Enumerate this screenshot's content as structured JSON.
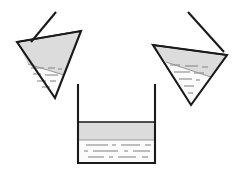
{
  "figure": {
    "background_color": "#ffffff",
    "width": 245,
    "height": 171,
    "stroke_color": "#1a1a1a",
    "liquid_band_color": "#dcdcdc",
    "liquid_body_color": "#fbfbfb",
    "dash_color": "#8a8a8a",
    "vessel_fill_color": "#ffffff"
  },
  "containers": [
    {
      "id": "left-funnel",
      "label": "Left tilted funnel",
      "shape": "cone",
      "orientation": "tilted-left",
      "has_stem": true,
      "stem_label": "Left funnel stem",
      "liquid_label": "Left funnel liquid",
      "surface_label": "Left funnel liquid surface",
      "outline_points": "17,42 81,31 55,98",
      "rim_points": "17,42 81,31",
      "stem_points": "31,42 56,12",
      "liquid_polygon": "17,42 81,31 64,75 28,64",
      "liquid_lower_polygon": "28,64 64,75 55,98",
      "surface_line": "17,42 81,31",
      "band_line": "28,64 64,75",
      "dashes": [
        {
          "x1": 31,
          "y1": 68,
          "x2": 44,
          "y2": 68
        },
        {
          "x1": 48,
          "y1": 68,
          "x2": 55,
          "y2": 68
        },
        {
          "x1": 58,
          "y1": 69,
          "x2": 62,
          "y2": 69
        },
        {
          "x1": 33,
          "y1": 74,
          "x2": 41,
          "y2": 74
        },
        {
          "x1": 45,
          "y1": 75,
          "x2": 58,
          "y2": 75
        },
        {
          "x1": 37,
          "y1": 81,
          "x2": 46,
          "y2": 81
        },
        {
          "x1": 50,
          "y1": 81,
          "x2": 56,
          "y2": 81
        },
        {
          "x1": 42,
          "y1": 87,
          "x2": 50,
          "y2": 87
        }
      ]
    },
    {
      "id": "right-funnel",
      "label": "Right tilted funnel",
      "shape": "cone",
      "orientation": "tilted-right",
      "has_stem": true,
      "stem_label": "Right funnel stem",
      "liquid_label": "Right funnel liquid",
      "surface_label": "Right funnel liquid surface",
      "outline_points": "153,45 227,55 191,105",
      "rim_points": "153,45 227,55",
      "stem_points": "224,52 188,12",
      "liquid_polygon": "153,45 227,55 211,77 166,62",
      "liquid_lower_polygon": "166,62 211,77 191,105",
      "surface_line": "153,45 227,55",
      "band_line": "166,62 211,77",
      "dashes": [
        {
          "x1": 170,
          "y1": 65,
          "x2": 180,
          "y2": 65
        },
        {
          "x1": 185,
          "y1": 66,
          "x2": 198,
          "y2": 66
        },
        {
          "x1": 202,
          "y1": 67,
          "x2": 208,
          "y2": 67
        },
        {
          "x1": 174,
          "y1": 72,
          "x2": 190,
          "y2": 72
        },
        {
          "x1": 194,
          "y1": 73,
          "x2": 204,
          "y2": 73
        },
        {
          "x1": 179,
          "y1": 79,
          "x2": 192,
          "y2": 79
        },
        {
          "x1": 196,
          "y1": 80,
          "x2": 200,
          "y2": 80
        },
        {
          "x1": 184,
          "y1": 86,
          "x2": 194,
          "y2": 86
        },
        {
          "x1": 188,
          "y1": 93,
          "x2": 193,
          "y2": 93
        }
      ]
    },
    {
      "id": "center-beaker",
      "label": "Center beaker",
      "shape": "beaker",
      "orientation": "upright",
      "has_stem": false,
      "liquid_label": "Beaker liquid",
      "surface_label": "Beaker liquid surface",
      "outline_points": "78,84 78,163 155,163 155,84",
      "left_wall": "78,84 78,163",
      "right_wall": "155,84 155,163",
      "bottom_wall": "78,163 155,163",
      "liquid_polygon": "79,122 154,122 154,162 79,162",
      "band_polygon": "79,122 154,122 154,140 79,140",
      "surface_line": "79,122 154,122",
      "band_line": "79,140 154,140",
      "dashes": [
        {
          "x1": 86,
          "y1": 145,
          "x2": 108,
          "y2": 145
        },
        {
          "x1": 112,
          "y1": 145,
          "x2": 116,
          "y2": 145
        },
        {
          "x1": 121,
          "y1": 145,
          "x2": 140,
          "y2": 145
        },
        {
          "x1": 145,
          "y1": 145,
          "x2": 151,
          "y2": 145
        },
        {
          "x1": 84,
          "y1": 151,
          "x2": 88,
          "y2": 151
        },
        {
          "x1": 93,
          "y1": 151,
          "x2": 118,
          "y2": 151
        },
        {
          "x1": 124,
          "y1": 151,
          "x2": 128,
          "y2": 151
        },
        {
          "x1": 133,
          "y1": 151,
          "x2": 150,
          "y2": 151
        },
        {
          "x1": 88,
          "y1": 157,
          "x2": 104,
          "y2": 157
        },
        {
          "x1": 109,
          "y1": 157,
          "x2": 113,
          "y2": 157
        },
        {
          "x1": 118,
          "y1": 157,
          "x2": 136,
          "y2": 157
        },
        {
          "x1": 142,
          "y1": 157,
          "x2": 148,
          "y2": 157
        }
      ]
    }
  ]
}
